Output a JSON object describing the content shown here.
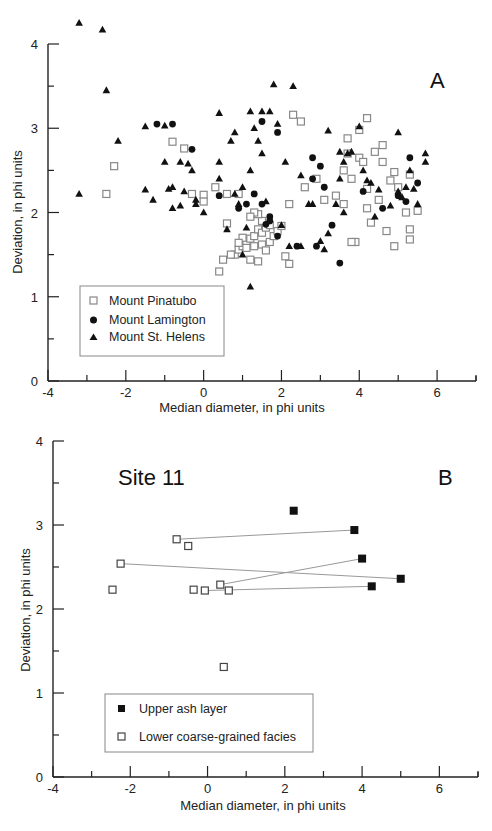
{
  "chart_data": [
    {
      "id": "A",
      "type": "scatter",
      "panel_label": "A",
      "title": "",
      "xlabel": "Median diameter, in phi units",
      "ylabel": "Deviation, in phi units",
      "xlim": [
        -4,
        7
      ],
      "ylim": [
        0,
        4
      ],
      "x_ticks": [
        -4,
        -2,
        0,
        2,
        4,
        6
      ],
      "y_ticks": [
        0,
        1,
        2,
        3,
        4
      ],
      "grid": false,
      "legend_position": "lower-left",
      "series": [
        {
          "name": "Mount Pinatubo",
          "marker": "open-square",
          "points": [
            [
              -2.3,
              2.55
            ],
            [
              -2.5,
              2.22
            ],
            [
              -0.8,
              2.84
            ],
            [
              -0.5,
              2.76
            ],
            [
              -0.3,
              2.22
            ],
            [
              0.0,
              2.21
            ],
            [
              0.0,
              2.13
            ],
            [
              0.3,
              2.3
            ],
            [
              0.6,
              2.22
            ],
            [
              0.9,
              2.22
            ],
            [
              0.6,
              1.87
            ],
            [
              0.8,
              1.5
            ],
            [
              0.9,
              1.56
            ],
            [
              1.0,
              1.6
            ],
            [
              1.1,
              1.66
            ],
            [
              1.2,
              1.69
            ],
            [
              1.3,
              1.72
            ],
            [
              1.4,
              1.8
            ],
            [
              1.5,
              1.76
            ],
            [
              1.6,
              1.82
            ],
            [
              1.7,
              1.85
            ],
            [
              1.5,
              1.9
            ],
            [
              1.4,
              1.98
            ],
            [
              1.3,
              2.0
            ],
            [
              1.2,
              1.95
            ],
            [
              1.0,
              1.7
            ],
            [
              0.9,
              1.64
            ],
            [
              1.1,
              1.58
            ],
            [
              1.3,
              1.6
            ],
            [
              1.5,
              1.62
            ],
            [
              1.7,
              1.65
            ],
            [
              1.8,
              1.72
            ],
            [
              1.9,
              1.78
            ],
            [
              2.0,
              1.84
            ],
            [
              1.6,
              1.55
            ],
            [
              1.2,
              1.44
            ],
            [
              0.4,
              1.3
            ],
            [
              0.5,
              1.44
            ],
            [
              0.7,
              1.5
            ],
            [
              1.4,
              1.42
            ],
            [
              2.1,
              1.48
            ],
            [
              2.2,
              1.39
            ],
            [
              2.6,
              2.3
            ],
            [
              2.2,
              2.1
            ],
            [
              2.3,
              3.16
            ],
            [
              2.5,
              3.08
            ],
            [
              3.7,
              2.88
            ],
            [
              3.7,
              2.7
            ],
            [
              3.8,
              2.4
            ],
            [
              4.0,
              2.65
            ],
            [
              4.1,
              2.6
            ],
            [
              4.2,
              2.28
            ],
            [
              4.5,
              2.15
            ],
            [
              4.2,
              2.05
            ],
            [
              3.6,
              2.5
            ],
            [
              3.6,
              2.1
            ],
            [
              4.3,
              1.88
            ],
            [
              4.7,
              1.78
            ],
            [
              5.3,
              1.8
            ],
            [
              5.2,
              2.0
            ],
            [
              5.5,
              2.02
            ],
            [
              5.0,
              2.3
            ],
            [
              4.8,
              2.38
            ],
            [
              4.9,
              2.48
            ],
            [
              5.3,
              1.68
            ],
            [
              4.9,
              1.6
            ],
            [
              3.9,
              1.65
            ],
            [
              3.8,
              1.65
            ],
            [
              4.4,
              2.72
            ],
            [
              4.6,
              2.6
            ],
            [
              4.6,
              2.8
            ],
            [
              5.3,
              2.45
            ],
            [
              4.0,
              2.98
            ],
            [
              4.2,
              3.12
            ],
            [
              3.1,
              2.15
            ],
            [
              2.9,
              2.4
            ],
            [
              3.4,
              2.2
            ]
          ]
        },
        {
          "name": "Mount Lamington",
          "marker": "filled-circle",
          "points": [
            [
              -1.2,
              3.05
            ],
            [
              -0.8,
              3.05
            ],
            [
              -0.3,
              2.75
            ],
            [
              0.4,
              2.2
            ],
            [
              1.3,
              2.22
            ],
            [
              0.9,
              2.05
            ],
            [
              1.1,
              2.1
            ],
            [
              1.5,
              3.08
            ],
            [
              1.9,
              2.95
            ],
            [
              1.5,
              2.1
            ],
            [
              1.7,
              1.95
            ],
            [
              1.7,
              1.9
            ],
            [
              1.6,
              1.86
            ],
            [
              1.9,
              1.72
            ],
            [
              2.4,
              1.6
            ],
            [
              2.9,
              1.6
            ],
            [
              2.8,
              2.4
            ],
            [
              2.8,
              2.65
            ],
            [
              3.0,
              2.55
            ],
            [
              3.1,
              2.3
            ],
            [
              3.3,
              1.85
            ],
            [
              3.5,
              1.4
            ],
            [
              5.5,
              2.35
            ],
            [
              5.3,
              2.65
            ],
            [
              5.0,
              2.2
            ],
            [
              4.6,
              2.05
            ],
            [
              5.2,
              2.13
            ],
            [
              4.1,
              2.25
            ]
          ]
        },
        {
          "name": "Mount St. Helens",
          "marker": "filled-triangle",
          "points": [
            [
              -3.2,
              4.25
            ],
            [
              -2.6,
              4.17
            ],
            [
              -2.5,
              3.45
            ],
            [
              -2.2,
              2.85
            ],
            [
              -3.2,
              2.22
            ],
            [
              -1.5,
              2.27
            ],
            [
              -1.3,
              2.15
            ],
            [
              -1.5,
              3.02
            ],
            [
              -1.0,
              3.03
            ],
            [
              -1.0,
              2.6
            ],
            [
              -0.9,
              2.28
            ],
            [
              -0.8,
              2.05
            ],
            [
              -0.6,
              2.08
            ],
            [
              -0.5,
              2.25
            ],
            [
              -0.4,
              2.58
            ],
            [
              -0.3,
              2.5
            ],
            [
              -0.2,
              2.15
            ],
            [
              -0.2,
              2.1
            ],
            [
              0.0,
              2.0
            ],
            [
              -0.8,
              2.3
            ],
            [
              -0.6,
              2.6
            ],
            [
              0.4,
              2.6
            ],
            [
              0.4,
              2.4
            ],
            [
              0.8,
              2.22
            ],
            [
              0.9,
              2.1
            ],
            [
              0.6,
              1.8
            ],
            [
              1.0,
              1.5
            ],
            [
              1.2,
              1.12
            ],
            [
              1.1,
              1.82
            ],
            [
              0.7,
              2.85
            ],
            [
              0.4,
              3.18
            ],
            [
              0.8,
              2.95
            ],
            [
              1.2,
              3.2
            ],
            [
              1.5,
              3.2
            ],
            [
              1.7,
              3.2
            ],
            [
              1.9,
              3.05
            ],
            [
              1.3,
              3.0
            ],
            [
              1.4,
              2.85
            ],
            [
              1.5,
              2.7
            ],
            [
              1.2,
              2.5
            ],
            [
              1.0,
              2.3
            ],
            [
              1.8,
              3.52
            ],
            [
              2.3,
              3.5
            ],
            [
              1.6,
              2.13
            ],
            [
              2.0,
              1.85
            ],
            [
              2.2,
              1.6
            ],
            [
              2.5,
              1.6
            ],
            [
              2.7,
              2.1
            ],
            [
              3.2,
              1.75
            ],
            [
              2.1,
              2.6
            ],
            [
              2.5,
              2.44
            ],
            [
              2.8,
              2.1
            ],
            [
              3.2,
              2.97
            ],
            [
              3.5,
              2.72
            ],
            [
              3.6,
              2.6
            ],
            [
              3.5,
              2.4
            ],
            [
              3.4,
              2.1
            ],
            [
              3.0,
              1.66
            ],
            [
              4.0,
              3.02
            ],
            [
              3.8,
              2.72
            ],
            [
              3.7,
              2.7
            ],
            [
              4.1,
              2.5
            ],
            [
              4.2,
              2.38
            ],
            [
              4.3,
              2.35
            ],
            [
              4.5,
              2.27
            ],
            [
              4.8,
              2.08
            ],
            [
              5.0,
              2.25
            ],
            [
              5.1,
              2.18
            ],
            [
              5.3,
              2.5
            ],
            [
              5.7,
              2.7
            ],
            [
              5.7,
              2.6
            ],
            [
              5.0,
              2.95
            ],
            [
              5.2,
              2.3
            ],
            [
              5.5,
              2.1
            ],
            [
              5.4,
              2.28
            ],
            [
              3.6,
              2.0
            ],
            [
              4.4,
              1.95
            ],
            [
              3.1,
              1.56
            ]
          ]
        }
      ]
    },
    {
      "id": "B",
      "type": "scatter",
      "panel_label": "B",
      "title": "Site 11",
      "xlabel": "Median diameter, in phi units",
      "ylabel": "Deviation, in phi units",
      "xlim": [
        -4,
        7
      ],
      "ylim": [
        0,
        4
      ],
      "x_ticks": [
        -4,
        -2,
        0,
        2,
        4,
        6
      ],
      "y_ticks": [
        0,
        1,
        2,
        3,
        4
      ],
      "grid": false,
      "legend_position": "lower-left",
      "series": [
        {
          "name": "Upper ash layer",
          "marker": "filled-square",
          "points": [
            [
              2.23,
              3.17
            ],
            [
              3.8,
              2.94
            ],
            [
              4.0,
              2.6
            ],
            [
              5.0,
              2.36
            ],
            [
              4.25,
              2.27
            ]
          ]
        },
        {
          "name": "Lower coarse-grained facies",
          "marker": "open-square",
          "points": [
            [
              -0.8,
              2.83
            ],
            [
              -0.5,
              2.75
            ],
            [
              -2.25,
              2.54
            ],
            [
              -2.46,
              2.23
            ],
            [
              -0.36,
              2.23
            ],
            [
              -0.07,
              2.22
            ],
            [
              0.33,
              2.29
            ],
            [
              0.55,
              2.22
            ],
            [
              0.42,
              1.31
            ]
          ]
        }
      ],
      "links": [
        {
          "from": [
            -0.8,
            2.83
          ],
          "to": [
            3.8,
            2.94
          ]
        },
        {
          "from": [
            -2.25,
            2.54
          ],
          "to": [
            5.0,
            2.36
          ]
        },
        {
          "from": [
            0.33,
            2.29
          ],
          "to": [
            4.0,
            2.6
          ]
        },
        {
          "from": [
            -0.07,
            2.22
          ],
          "to": [
            4.25,
            2.27
          ]
        }
      ]
    }
  ]
}
